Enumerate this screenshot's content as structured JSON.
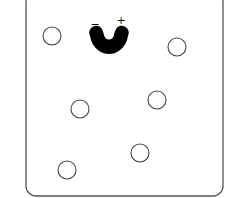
{
  "diagram": {
    "container": {
      "x": 26,
      "y": -8,
      "width": 197,
      "height": 204,
      "rx": 10,
      "stroke": "#555555"
    },
    "receptor": {
      "shape": "u-shaped-binding-site",
      "cx": 109,
      "cy": 38,
      "fill": "#000000",
      "charges": [
        {
          "label": "−",
          "x": 95,
          "y": 28
        },
        {
          "label": "+",
          "x": 121,
          "y": 24
        }
      ]
    },
    "particles": [
      {
        "cx": 52,
        "cy": 36,
        "r": 9
      },
      {
        "cx": 177,
        "cy": 47,
        "r": 9
      },
      {
        "cx": 80,
        "cy": 109,
        "r": 9
      },
      {
        "cx": 157,
        "cy": 100,
        "r": 9
      },
      {
        "cx": 140,
        "cy": 153,
        "r": 9
      },
      {
        "cx": 67,
        "cy": 170,
        "r": 9
      }
    ]
  }
}
